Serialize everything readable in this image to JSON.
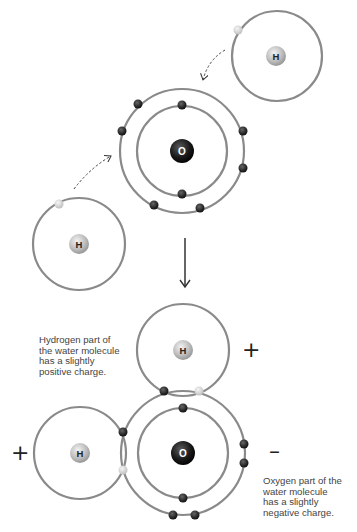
{
  "diagram": {
    "colors": {
      "orbit": "#8a8a8a",
      "electron_oxygen": "#2b2b2b",
      "electron_hydrogen": "#d6d6d6",
      "nucleus_oxygen": "#1a1a1a",
      "nucleus_hydrogen": "#bdbdbd",
      "arrow": "#333333"
    },
    "before": {
      "oxygen": {
        "symbol": "O",
        "center": [
          182,
          151
        ],
        "inner_radius": 45,
        "outer_radius": 62,
        "inner_electrons": 2,
        "outer_electrons": 6
      },
      "hydrogen_top_right": {
        "symbol": "H",
        "center": [
          277,
          56
        ],
        "radius": 45,
        "electrons": 1
      },
      "hydrogen_bottom_left": {
        "symbol": "H",
        "center": [
          79,
          244
        ],
        "radius": 46,
        "electrons": 1
      }
    },
    "reaction_arrow": "down-arrow",
    "after": {
      "oxygen": {
        "symbol": "O",
        "center": [
          183,
          453
        ],
        "inner_radius": 45,
        "outer_radius": 62
      },
      "hydrogen_top": {
        "symbol": "H",
        "center": [
          183,
          350
        ],
        "radius": 46
      },
      "hydrogen_left": {
        "symbol": "H",
        "center": [
          80,
          453
        ],
        "radius": 46
      }
    },
    "labels": {
      "hydrogen_symbol": "H",
      "oxygen_symbol": "O",
      "plus_top": "+",
      "plus_left": "+",
      "minus": "–",
      "hydrogen_caption": "Hydrogen part of\nthe water molecule\nhas a slightly\npositive charge.",
      "oxygen_caption": "Oxygen part of the\nwater molecule\nhas a slightly\nnegative charge."
    }
  }
}
